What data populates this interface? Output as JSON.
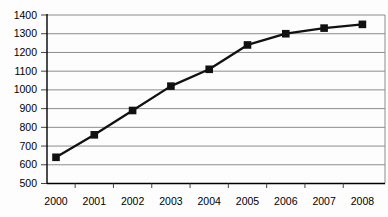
{
  "chart_data": {
    "type": "line",
    "title": "",
    "xlabel": "",
    "ylabel": "",
    "categories": [
      "2000",
      "2001",
      "2002",
      "2003",
      "2004",
      "2005",
      "2006",
      "2007",
      "2008"
    ],
    "series": [
      {
        "name": "series-1",
        "values": [
          640,
          760,
          890,
          1020,
          1110,
          1240,
          1300,
          1330,
          1350
        ]
      }
    ],
    "ylim": [
      500,
      1400
    ],
    "yticks": [
      500,
      600,
      700,
      800,
      900,
      1000,
      1100,
      1200,
      1300,
      1400
    ],
    "grid": "horizontal",
    "legend": "none",
    "marker": "filled-square",
    "colors": {
      "line": "#111111",
      "marker": "#111111",
      "gridline": "#8c8c8c",
      "axis": "#000000",
      "plot_border": "#8c8c8c",
      "tick": "#444444",
      "label_text": "#000000",
      "background": "#fdfdfd"
    }
  }
}
